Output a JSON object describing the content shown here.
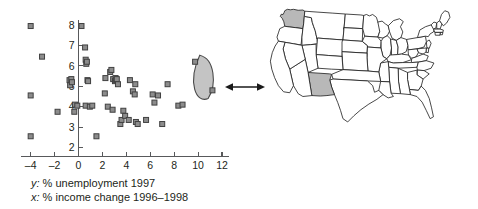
{
  "caption": {
    "y_key": "y:",
    "y_text": " % unemployment 1997",
    "x_key": "x:",
    "x_text": " % income change 1996–1998"
  },
  "callout": {
    "arrow_name": "double-headed-arrow",
    "ellipse_label": "outlier-group-ellipse"
  },
  "map": {
    "name": "united-states-map",
    "highlighted_states": [
      "Washington",
      "New Mexico"
    ],
    "highlight_color": "#b8b8b8",
    "base_color": "#ffffff",
    "outline_color": "#1a1a1a"
  },
  "chart_data": {
    "type": "scatter",
    "title": "",
    "xlabel": "x: % income change 1996–1998",
    "ylabel": "y: % unemployment 1997",
    "xlim": [
      -4.8,
      12.6
    ],
    "ylim": [
      1.8,
      8.3
    ],
    "xticks": [
      -4,
      -2,
      0,
      2,
      4,
      6,
      8,
      10,
      12
    ],
    "yticks": [
      2,
      3,
      4,
      5,
      6,
      7,
      8
    ],
    "grid": false,
    "legend": "none",
    "marker": {
      "shape": "square",
      "fill": "#8c8c8c",
      "edge": "#404040",
      "size_px": 5
    },
    "points": [
      [
        -4.0,
        7.95
      ],
      [
        -3.05,
        6.45
      ],
      [
        -4.0,
        4.55
      ],
      [
        -1.75,
        3.75
      ],
      [
        -4.0,
        2.55
      ],
      [
        -0.75,
        5.3
      ],
      [
        -0.7,
        5.05
      ],
      [
        -0.6,
        5.35
      ],
      [
        -0.55,
        5.2
      ],
      [
        -0.3,
        4.1
      ],
      [
        -0.35,
        3.75
      ],
      [
        -0.1,
        4.05
      ],
      [
        0.25,
        7.95
      ],
      [
        0.55,
        6.9
      ],
      [
        0.6,
        6.3
      ],
      [
        0.65,
        6.1
      ],
      [
        0.7,
        6.2
      ],
      [
        0.75,
        5.3
      ],
      [
        0.8,
        5.25
      ],
      [
        0.6,
        4.05
      ],
      [
        0.95,
        4.0
      ],
      [
        1.15,
        4.05
      ],
      [
        1.5,
        2.55
      ],
      [
        2.25,
        5.4
      ],
      [
        2.2,
        4.65
      ],
      [
        2.65,
        5.7
      ],
      [
        2.75,
        5.8
      ],
      [
        2.9,
        5.35
      ],
      [
        3.05,
        5.25
      ],
      [
        3.1,
        5.4
      ],
      [
        3.15,
        5.3
      ],
      [
        3.2,
        5.35
      ],
      [
        2.45,
        4.0
      ],
      [
        2.85,
        3.85
      ],
      [
        3.3,
        5.1
      ],
      [
        3.5,
        3.15
      ],
      [
        3.6,
        3.35
      ],
      [
        3.75,
        3.8
      ],
      [
        3.9,
        3.55
      ],
      [
        4.2,
        3.35
      ],
      [
        4.3,
        5.3
      ],
      [
        4.55,
        4.75
      ],
      [
        4.75,
        5.1
      ],
      [
        4.7,
        4.6
      ],
      [
        4.8,
        3.25
      ],
      [
        4.95,
        3.15
      ],
      [
        5.65,
        3.35
      ],
      [
        6.2,
        4.6
      ],
      [
        6.35,
        4.2
      ],
      [
        6.65,
        4.55
      ],
      [
        7.0,
        3.15
      ],
      [
        7.45,
        5.1
      ],
      [
        8.35,
        4.05
      ],
      [
        8.7,
        4.1
      ],
      [
        9.75,
        6.2
      ],
      [
        11.2,
        4.8
      ]
    ],
    "highlighted_points": [
      [
        9.75,
        6.2
      ],
      [
        11.2,
        4.8
      ]
    ],
    "annotation": {
      "shape": "ellipse",
      "center": [
        10.4,
        5.45
      ],
      "fill": "#c4c4c4",
      "stroke": "#4a4a4a",
      "points_to": "united-states-map"
    }
  }
}
